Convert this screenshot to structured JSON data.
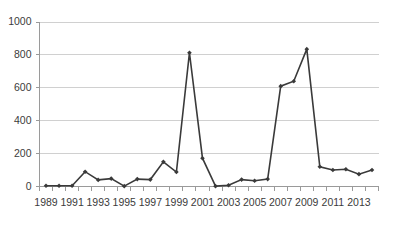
{
  "chart_data": {
    "type": "line",
    "title": "",
    "subtitle": "",
    "xlabel": "",
    "ylabel": "",
    "ylim": [
      0,
      1000
    ],
    "yticks": [
      0,
      200,
      400,
      600,
      800,
      1000
    ],
    "ytick_labels": [
      "0",
      "200",
      "400",
      "600",
      "800",
      "1000"
    ],
    "grid": true,
    "legend": false,
    "legend_position": "none",
    "marker": "diamond",
    "line_color": "#3a3a3a",
    "grid_color": "#d0d0d0",
    "axis_color": "#9a9a9a",
    "background_color": "#ffffff",
    "categories": [
      "1989",
      "1990",
      "1991",
      "1992",
      "1993",
      "1994",
      "1995",
      "1996",
      "1997",
      "1998",
      "1999",
      "2000",
      "2001",
      "2002",
      "2003",
      "2004",
      "2005",
      "2006",
      "2007",
      "2008",
      "2009",
      "2010",
      "2011",
      "2012",
      "2013",
      "2014"
    ],
    "xtick_labels_shown": [
      "1989",
      "1991",
      "1993",
      "1995",
      "1997",
      "1999",
      "2001",
      "2003",
      "2005",
      "2007",
      "2009",
      "2011",
      "2013"
    ],
    "values": [
      5,
      5,
      5,
      90,
      40,
      48,
      2,
      45,
      42,
      150,
      88,
      813,
      172,
      2,
      8,
      42,
      35,
      45,
      610,
      640,
      835,
      120,
      100,
      105,
      75,
      100
    ],
    "series": [
      {
        "name": "",
        "values": [
          5,
          5,
          5,
          90,
          40,
          48,
          2,
          45,
          42,
          150,
          88,
          813,
          172,
          2,
          8,
          42,
          35,
          45,
          610,
          640,
          835,
          120,
          100,
          105,
          75,
          100
        ]
      }
    ]
  }
}
